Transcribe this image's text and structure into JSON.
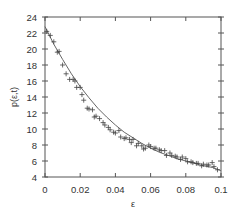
{
  "chart_data": {
    "type": "scatter",
    "title": "",
    "xlabel": "ε",
    "ylabel": "p(ε,t)",
    "xlim": [
      0,
      0.1
    ],
    "ylim": [
      4,
      24
    ],
    "xticks": [
      0,
      0.02,
      0.04,
      0.06,
      0.08,
      0.1
    ],
    "xtick_labels": [
      "0",
      "0.02",
      "0.04",
      "0.06",
      "0.08",
      "0.1"
    ],
    "yticks": [
      4,
      6,
      8,
      10,
      12,
      14,
      16,
      18,
      20,
      22,
      24
    ],
    "ytick_labels": [
      "4",
      "6",
      "8",
      "10",
      "12",
      "14",
      "16",
      "18",
      "20",
      "22",
      "24"
    ],
    "grid": false,
    "legend": null,
    "series": [
      {
        "name": "data",
        "marker": "+",
        "x": [
          0.001,
          0.003,
          0.005,
          0.007,
          0.008,
          0.01,
          0.012,
          0.014,
          0.016,
          0.017,
          0.018,
          0.02,
          0.021,
          0.022,
          0.024,
          0.025,
          0.027,
          0.028,
          0.029,
          0.031,
          0.033,
          0.034,
          0.036,
          0.037,
          0.039,
          0.04,
          0.042,
          0.043,
          0.045,
          0.046,
          0.048,
          0.049,
          0.05,
          0.052,
          0.053,
          0.055,
          0.056,
          0.057,
          0.059,
          0.06,
          0.062,
          0.063,
          0.065,
          0.066,
          0.068,
          0.069,
          0.071,
          0.072,
          0.074,
          0.075,
          0.077,
          0.078,
          0.08,
          0.081,
          0.083,
          0.084,
          0.086,
          0.087,
          0.089,
          0.09,
          0.092,
          0.093,
          0.095,
          0.096,
          0.098
        ],
        "y": [
          22.2,
          21.7,
          20.9,
          19.6,
          19.7,
          18.0,
          16.9,
          16.2,
          16.2,
          16.0,
          15.2,
          15.2,
          14.3,
          13.6,
          12.6,
          12.5,
          12.4,
          11.5,
          11.6,
          11.3,
          10.8,
          10.5,
          10.2,
          9.9,
          9.6,
          9.5,
          9.8,
          9.0,
          8.8,
          8.9,
          8.7,
          8.3,
          8.7,
          7.9,
          8.2,
          7.9,
          7.5,
          7.6,
          8.0,
          7.8,
          7.6,
          7.6,
          7.4,
          7.3,
          7.3,
          6.7,
          7.0,
          6.7,
          6.6,
          6.5,
          6.2,
          6.5,
          6.3,
          5.9,
          5.9,
          5.8,
          5.7,
          5.7,
          5.4,
          5.6,
          5.5,
          5.5,
          5.8,
          5.3,
          4.9
        ]
      },
      {
        "name": "fit",
        "type": "line",
        "x": [
          0.0,
          0.005,
          0.01,
          0.015,
          0.02,
          0.025,
          0.03,
          0.035,
          0.04,
          0.045,
          0.05,
          0.055,
          0.06,
          0.065,
          0.07,
          0.075,
          0.08,
          0.085,
          0.09,
          0.095,
          0.1
        ],
        "y": [
          22.8,
          20.6,
          18.7,
          16.9,
          15.3,
          13.9,
          12.6,
          11.5,
          10.5,
          9.6,
          8.9,
          8.2,
          7.6,
          7.1,
          6.7,
          6.3,
          6.0,
          5.7,
          5.4,
          5.2,
          4.8
        ]
      }
    ]
  },
  "colors": {
    "axis": "#555555",
    "marker": "#444444",
    "fit_line": "#666666",
    "background": "#ffffff"
  }
}
